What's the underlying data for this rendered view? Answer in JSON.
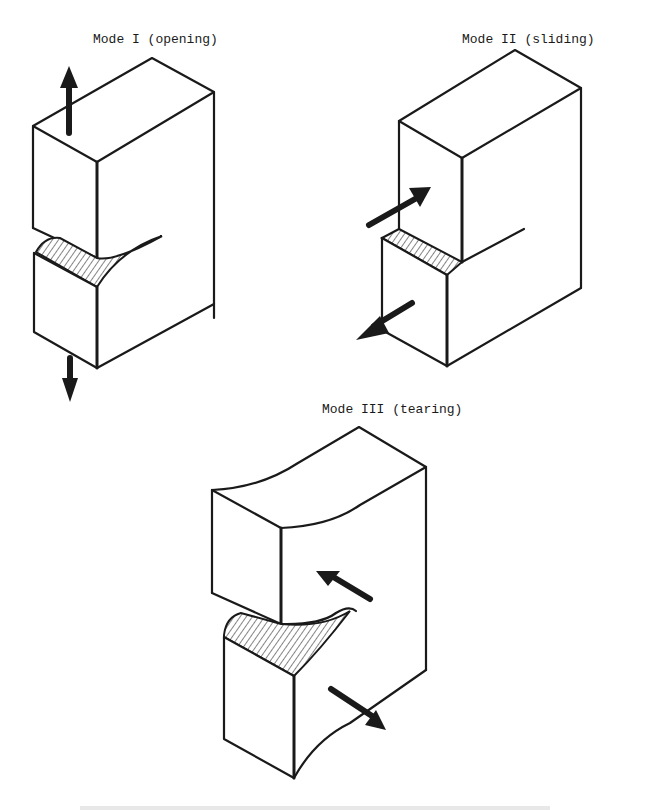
{
  "figure": {
    "modes": [
      {
        "id": "mode-1",
        "label": "Mode I (opening)",
        "loading": "tensile, normal to crack plane",
        "arrows": [
          "up",
          "down"
        ]
      },
      {
        "id": "mode-2",
        "label": "Mode II (sliding)",
        "loading": "in-plane shear",
        "arrows": [
          "in-plane-forward",
          "in-plane-backward"
        ]
      },
      {
        "id": "mode-3",
        "label": "Mode III (tearing)",
        "loading": "out-of-plane shear",
        "arrows": [
          "out-of-plane-left",
          "out-of-plane-right"
        ]
      }
    ],
    "caption_partial": "",
    "colors": {
      "ink": "#1a1a1a",
      "background": "#ffffff",
      "caption_faint": "#d6d6d6"
    }
  }
}
